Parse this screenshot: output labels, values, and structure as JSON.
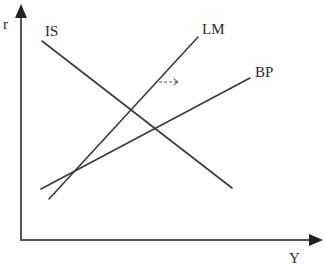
{
  "diagram": {
    "axes": {
      "y_label": "r",
      "x_label": "Y"
    },
    "curves": [
      {
        "id": "is",
        "label": "IS",
        "slope": "downward"
      },
      {
        "id": "lm",
        "label": "LM",
        "slope": "upward-steep"
      },
      {
        "id": "bp",
        "label": "BP",
        "slope": "upward-flat"
      }
    ],
    "annotations": [
      {
        "id": "lm-shift",
        "type": "dashed-arrow",
        "direction": "right",
        "applies_to": "LM"
      }
    ],
    "colors": {
      "line": "#3a3a3a",
      "axis": "#555555",
      "text": "#2a2a2a",
      "background": "#ffffff"
    }
  }
}
